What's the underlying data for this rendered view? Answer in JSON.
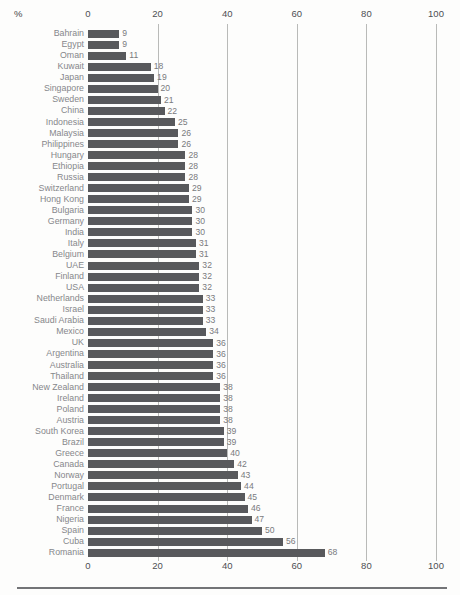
{
  "page": {
    "background": "#fdfdfc"
  },
  "chart_data": {
    "type": "bar",
    "orientation": "horizontal",
    "title": "",
    "unit_label": "%",
    "xlabel": "%",
    "ylabel": "",
    "xlim": [
      0,
      100
    ],
    "x_ticks": [
      0,
      20,
      40,
      60,
      80,
      100
    ],
    "grid": "vertical gridlines at 20, 40, 60, 80, 100",
    "axis_labels_position": "top and bottom",
    "legend": "none",
    "colors": {
      "bar": "#58595c",
      "gridline": "#b9bab8",
      "country_label": "#86878b",
      "value_label": "#797a7d",
      "tick_label": "#4e4f53",
      "rule": "#737477"
    },
    "categories": [
      "Bahrain",
      "Egypt",
      "Oman",
      "Kuwait",
      "Japan",
      "Singapore",
      "Sweden",
      "China",
      "Indonesia",
      "Malaysia",
      "Philippines",
      "Hungary",
      "Ethiopia",
      "Russia",
      "Switzerland",
      "Hong Kong",
      "Bulgaria",
      "Germany",
      "India",
      "Italy",
      "Belgium",
      "UAE",
      "Finland",
      "USA",
      "Netherlands",
      "Israel",
      "Saudi Arabia",
      "Mexico",
      "UK",
      "Argentina",
      "Australia",
      "Thailand",
      "New Zealand",
      "Ireland",
      "Poland",
      "Austria",
      "South Korea",
      "Brazil",
      "Greece",
      "Canada",
      "Norway",
      "Portugal",
      "Denmark",
      "France",
      "Nigeria",
      "Spain",
      "Cuba",
      "Romania"
    ],
    "values": [
      9,
      9,
      11,
      18,
      19,
      20,
      21,
      22,
      25,
      26,
      26,
      28,
      28,
      28,
      29,
      29,
      30,
      30,
      30,
      31,
      31,
      32,
      32,
      32,
      33,
      33,
      33,
      34,
      36,
      36,
      36,
      36,
      38,
      38,
      38,
      38,
      39,
      39,
      40,
      42,
      43,
      44,
      45,
      46,
      47,
      50,
      56,
      68
    ]
  }
}
